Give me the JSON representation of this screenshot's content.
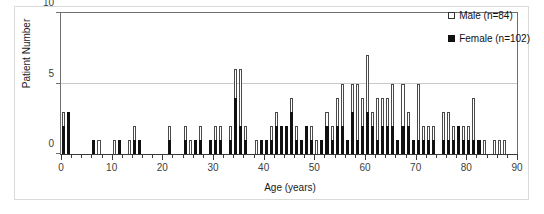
{
  "chart_data": {
    "type": "bar",
    "subtype": "stacked-histogram",
    "title": "",
    "xlabel": "Age (years)",
    "ylabel": "Patient Number",
    "xlim": [
      0,
      90
    ],
    "ylim": [
      0,
      10
    ],
    "y_ticks": [
      0,
      5,
      10
    ],
    "x_ticks_major": [
      0,
      10,
      20,
      30,
      40,
      50,
      60,
      70,
      80,
      90
    ],
    "x_tick_minor_step": 2,
    "grid": "horizontal-at-5",
    "legend_position": "top-right",
    "bin_width": 1,
    "x": [
      0,
      1,
      2,
      3,
      4,
      5,
      6,
      7,
      8,
      9,
      10,
      11,
      12,
      13,
      14,
      15,
      16,
      17,
      18,
      19,
      20,
      21,
      22,
      23,
      24,
      25,
      26,
      27,
      28,
      29,
      30,
      31,
      32,
      33,
      34,
      35,
      36,
      37,
      38,
      39,
      40,
      41,
      42,
      43,
      44,
      45,
      46,
      47,
      48,
      49,
      50,
      51,
      52,
      53,
      54,
      55,
      56,
      57,
      58,
      59,
      60,
      61,
      62,
      63,
      64,
      65,
      66,
      67,
      68,
      69,
      70,
      71,
      72,
      73,
      74,
      75,
      76,
      77,
      78,
      79,
      80,
      81,
      82,
      83,
      84,
      85,
      86,
      87,
      88,
      89
    ],
    "series": [
      {
        "name": "Female (n=102)",
        "short_name": "Female",
        "count": 102,
        "color": "#111111",
        "marker": "filled-square",
        "values": [
          2,
          3,
          0,
          0,
          0,
          0,
          1,
          0,
          0,
          0,
          0,
          1,
          0,
          0,
          1,
          1,
          0,
          0,
          0,
          0,
          0,
          1,
          0,
          0,
          1,
          0,
          1,
          1,
          0,
          1,
          1,
          1,
          0,
          1,
          4,
          2,
          1,
          0,
          0,
          1,
          1,
          1,
          2,
          2,
          2,
          3,
          1,
          1,
          2,
          1,
          0,
          1,
          2,
          1,
          2,
          2,
          1,
          3,
          1,
          2,
          3,
          2,
          1,
          2,
          2,
          2,
          1,
          2,
          2,
          1,
          1,
          1,
          1,
          1,
          0,
          1,
          1,
          1,
          2,
          1,
          1,
          1,
          1,
          0,
          0,
          0,
          0,
          0,
          0,
          0
        ]
      },
      {
        "name": "Male (n=84)",
        "short_name": "Male",
        "count": 84,
        "color": "#ffffff",
        "marker": "open-square",
        "values": [
          1,
          0,
          0,
          0,
          0,
          0,
          0,
          1,
          0,
          0,
          1,
          0,
          0,
          1,
          1,
          0,
          0,
          0,
          0,
          0,
          0,
          1,
          0,
          0,
          1,
          1,
          0,
          1,
          0,
          0,
          1,
          1,
          0,
          1,
          2,
          4,
          1,
          0,
          1,
          0,
          0,
          1,
          1,
          0,
          0,
          1,
          1,
          0,
          0,
          1,
          1,
          0,
          1,
          1,
          2,
          3,
          0,
          2,
          4,
          2,
          4,
          1,
          3,
          2,
          2,
          3,
          0,
          3,
          1,
          0,
          4,
          1,
          1,
          1,
          0,
          2,
          2,
          1,
          0,
          1,
          1,
          3,
          0,
          1,
          0,
          1,
          1,
          1,
          0,
          0
        ]
      }
    ],
    "totals": [
      3,
      3,
      0,
      0,
      0,
      0,
      1,
      1,
      0,
      0,
      1,
      1,
      0,
      1,
      2,
      1,
      0,
      0,
      0,
      0,
      0,
      2,
      0,
      0,
      2,
      1,
      1,
      2,
      0,
      1,
      2,
      2,
      0,
      2,
      6,
      6,
      2,
      0,
      1,
      1,
      1,
      2,
      3,
      2,
      2,
      4,
      2,
      1,
      2,
      2,
      1,
      1,
      3,
      2,
      4,
      5,
      1,
      5,
      5,
      4,
      7,
      3,
      4,
      4,
      4,
      5,
      1,
      5,
      3,
      1,
      5,
      2,
      2,
      2,
      0,
      3,
      3,
      2,
      2,
      2,
      2,
      4,
      1,
      1,
      0,
      1,
      1,
      1,
      0,
      0
    ]
  },
  "legend": {
    "items": [
      {
        "label": "Male (n=84)",
        "swatch": "open-square"
      },
      {
        "label": "Female (n=102)",
        "swatch": "filled-square"
      }
    ]
  },
  "axes": {
    "y_title": "Patient Number",
    "x_title": "Age (years)",
    "y_tick_labels": [
      "0",
      "5",
      "10"
    ],
    "x_tick_labels": [
      "0",
      "10",
      "20",
      "30",
      "40",
      "50",
      "60",
      "70",
      "80",
      "90"
    ]
  }
}
